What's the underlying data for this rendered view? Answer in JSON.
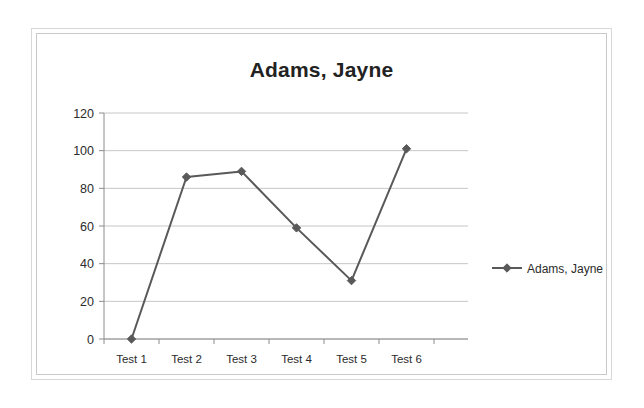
{
  "document": {
    "background_color": "#ffffff",
    "frame_border_color": "#d8d8d8"
  },
  "chart_data": {
    "type": "line",
    "title": "Adams, Jayne",
    "xlabel": "",
    "ylabel": "",
    "categories": [
      "Test 1",
      "Test 2",
      "Test 3",
      "Test 4",
      "Test 5",
      "Test 6"
    ],
    "series": [
      {
        "name": "Adams, Jayne",
        "values": [
          0,
          86,
          89,
          59,
          31,
          101
        ],
        "color": "#595959",
        "marker": "diamond"
      }
    ],
    "ylim": [
      0,
      120
    ],
    "yticks": [
      0,
      20,
      40,
      60,
      80,
      100,
      120
    ],
    "ytick_labels": [
      "0",
      "20",
      "40",
      "60",
      "80",
      "100",
      "120"
    ],
    "grid": {
      "horizontal": true,
      "vertical": false,
      "color": "#c6c6c6"
    },
    "legend": {
      "position": "right",
      "entries": [
        {
          "label": "Adams, Jayne",
          "color": "#595959",
          "marker": "diamond"
        }
      ]
    },
    "axis_color": "#8c8c8c",
    "plot_background": "#ffffff"
  }
}
